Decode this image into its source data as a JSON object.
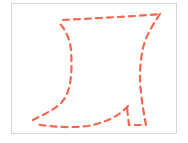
{
  "canvas": {
    "label": "drawing-canvas",
    "border_color": "#d6d6d6",
    "background": "#ffffff"
  },
  "shape": {
    "name": "dashed-outline-shape",
    "stroke_color": "#f2674f",
    "stroke_width": 2.2,
    "dash_pattern": "6 5",
    "path": "M63,20 L100,18 L135,16 L161,14 M160,14 C152,26 146,36 143,48 C140,62 139,78 141,92 C142,104 144,114 146,125 L129,125 L127,108 M128,106 C118,117 104,123 88,126 C72,128 52,127 35,124 M33,120 C46,113 60,108 66,96 C72,84 72,66 71,50 C70,40 66,30 60,24"
  }
}
